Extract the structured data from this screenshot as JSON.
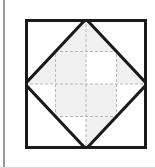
{
  "figure": {
    "kind": "geometric-block-diagram",
    "background_color": "#ffffff"
  },
  "frame": {
    "left_rule_color": "#9a9a9a",
    "bottom_rule_color": "#d9d9d9",
    "canvas_color": "#ffffff"
  },
  "block": {
    "outline_color": "#1a1a1a",
    "outline_width": 3,
    "fill_color": "#ffffff",
    "x": 0,
    "y": 0,
    "width": 122,
    "height": 130
  },
  "grid": {
    "columns": 4,
    "rows": 4,
    "line_color": "#b8b8b8",
    "line_width": 1,
    "dash": "3 2",
    "style": "dashed",
    "x_positions": [
      0,
      30.5,
      61,
      91.5,
      122
    ],
    "y_positions": [
      0,
      32.5,
      65,
      97.5,
      130
    ]
  },
  "triangles": [
    {
      "name": "top-left-triangle",
      "color": "#1a1a1a",
      "stroke_width": 3,
      "points": "0,0 61,0 0,65"
    },
    {
      "name": "top-right-triangle",
      "color": "#1a1a1a",
      "stroke_width": 3,
      "points": "61,0 122,0 122,65"
    },
    {
      "name": "bottom-left-triangle",
      "color": "#1a1a1a",
      "stroke_width": 3,
      "points": "0,65 0,130 61,130"
    },
    {
      "name": "bottom-right-triangle",
      "color": "#1a1a1a",
      "stroke_width": 3,
      "points": "122,65 122,130 61,130"
    }
  ],
  "shaded_cells": {
    "fill_color": "#f0f0f0",
    "count": 8,
    "cells": [
      {
        "col": 2,
        "row": 1,
        "x": 30.5,
        "y": 0,
        "w": 30.5,
        "h": 32.5
      },
      {
        "col": 3,
        "row": 1,
        "x": 61,
        "y": 0,
        "w": 30.5,
        "h": 32.5
      },
      {
        "col": 1,
        "row": 2,
        "x": 0,
        "y": 32.5,
        "w": 30.5,
        "h": 32.5
      },
      {
        "col": 2,
        "row": 2,
        "x": 30.5,
        "y": 32.5,
        "w": 30.5,
        "h": 32.5
      },
      {
        "col": 4,
        "row": 2,
        "x": 91.5,
        "y": 32.5,
        "w": 30.5,
        "h": 32.5
      },
      {
        "col": 2,
        "row": 3,
        "x": 30.5,
        "y": 65,
        "w": 30.5,
        "h": 32.5
      },
      {
        "col": 3,
        "row": 3,
        "x": 61,
        "y": 65,
        "w": 30.5,
        "h": 32.5
      },
      {
        "col": 3,
        "row": 4,
        "x": 61,
        "y": 97.5,
        "w": 30.5,
        "h": 32.5
      }
    ]
  }
}
